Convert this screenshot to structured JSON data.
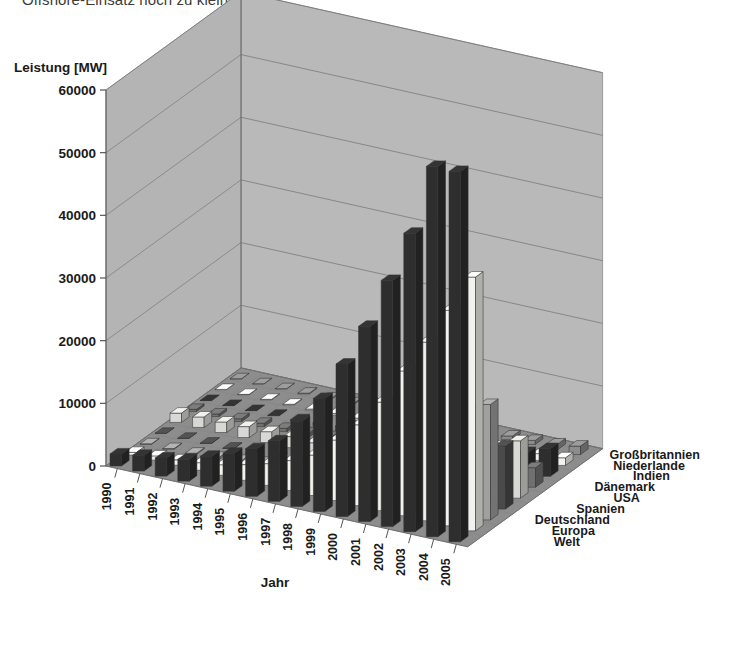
{
  "page": {
    "clipped_heading": "Offshore-Einsatz noch zu klein."
  },
  "axes": {
    "y_title": "Leistung [MW]",
    "x_title": "Jahr",
    "y_ticks": [
      "0",
      "10000",
      "20000",
      "30000",
      "40000",
      "50000",
      "60000"
    ]
  },
  "chart_data": {
    "type": "bar",
    "subtype": "3d-grouped-bar",
    "title": "",
    "xlabel": "Jahr",
    "ylabel": "Leistung [MW]",
    "zlabel": "",
    "ylim": [
      0,
      60000
    ],
    "ytick_step": 10000,
    "grid": true,
    "legend_position": "right-depth-axis",
    "categories": [
      "1990",
      "1991",
      "1992",
      "1993",
      "1994",
      "1995",
      "1996",
      "1997",
      "1998",
      "1999",
      "2000",
      "2001",
      "2002",
      "2003",
      "2004",
      "2005"
    ],
    "series": [
      {
        "name": "Welt",
        "color": "#2e2e2e",
        "values": [
          1930,
          2510,
          2890,
          3490,
          4780,
          6070,
          7600,
          9660,
          13600,
          18040,
          24320,
          31150,
          39290,
          47620,
          59090,
          59090
        ]
      },
      {
        "name": "Europa",
        "color": "#f2f2ee",
        "values": [
          440,
          680,
          850,
          1210,
          1680,
          2510,
          3470,
          4770,
          6450,
          9660,
          12890,
          17320,
          23100,
          28490,
          34370,
          40500
        ]
      },
      {
        "name": "Deutschland",
        "color": "#a0a0a0",
        "values": [
          60,
          110,
          180,
          330,
          640,
          1130,
          1550,
          2080,
          2870,
          4440,
          6110,
          8750,
          11990,
          14610,
          16630,
          18430
        ]
      },
      {
        "name": "Spanien",
        "color": "#4a4a4a",
        "values": [
          7,
          10,
          50,
          52,
          73,
          145,
          249,
          512,
          834,
          1812,
          2535,
          3337,
          4830,
          6202,
          8263,
          10027
        ]
      },
      {
        "name": "USA",
        "color": "#d8d8d4",
        "values": [
          1484,
          1680,
          1680,
          1745,
          1745,
          1770,
          1590,
          1590,
          1820,
          2500,
          2564,
          4275,
          4685,
          6374,
          6740,
          9149
        ]
      },
      {
        "name": "Dänemark",
        "color": "#707070",
        "values": [
          343,
          413,
          458,
          539,
          539,
          637,
          835,
          1116,
          1420,
          1742,
          2340,
          2489,
          2880,
          3110,
          3118,
          3128
        ]
      },
      {
        "name": "Indien",
        "color": "#2e2e2e",
        "values": [
          20,
          39,
          39,
          85,
          185,
          565,
          820,
          940,
          992,
          1035,
          1220,
          1507,
          1702,
          2110,
          3000,
          4430
        ]
      },
      {
        "name": "Niederlande",
        "color": "#f2f2ee",
        "values": [
          50,
          60,
          80,
          100,
          150,
          240,
          300,
          330,
          360,
          410,
          440,
          480,
          680,
          910,
          1080,
          1220
        ]
      },
      {
        "name": "Großbritannien",
        "color": "#8c8c8c",
        "values": [
          10,
          20,
          40,
          130,
          170,
          200,
          260,
          320,
          330,
          350,
          410,
          490,
          550,
          650,
          890,
          1350
        ]
      }
    ]
  },
  "style": {
    "wall_back": "#b9b9b9",
    "wall_side": "#b4b4b4",
    "floor": "#8d8d8d",
    "gridline": "#6f6f6f",
    "axis_line": "#555555",
    "text": "#1a1a1a"
  }
}
